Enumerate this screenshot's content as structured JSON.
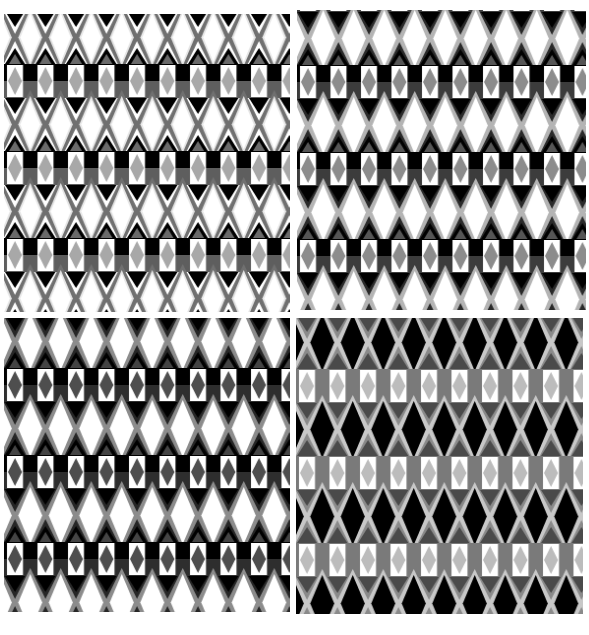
{
  "figure": {
    "panels": [
      {
        "id": "top-left",
        "x": 4,
        "y": 14,
        "w": 286,
        "h": 298,
        "offset_y": 50,
        "colors": {
          "diamond": "#ffffff",
          "diamond_halo": "#e6e6e6",
          "outline": "#707070",
          "tri_down": "#000000",
          "tri_up": "#6a6a6a",
          "band_top": "#000000",
          "band_bottom": "#5e5e5e",
          "cell": "#ffffff",
          "cell_diamond": "#a8a8a8",
          "bg": "#ffffff"
        }
      },
      {
        "id": "top-right",
        "x": 297,
        "y": 10,
        "w": 289,
        "h": 300,
        "offset_y": 55,
        "colors": {
          "diamond": "#ffffff",
          "diamond_halo": "#ffffff",
          "outline": "#b4b4b4",
          "tri_down": "#000000",
          "tri_up": "#555555",
          "band_top": "#000000",
          "band_bottom": "#3c3c3c",
          "cell": "#ffffff",
          "cell_diamond": "#8c8c8c",
          "bg": "#2a2a2a"
        }
      },
      {
        "id": "bottom-left",
        "x": 4,
        "y": 318,
        "w": 286,
        "h": 294,
        "offset_y": 50,
        "colors": {
          "diamond": "#ffffff",
          "diamond_halo": "#ffffff",
          "outline": "#8c8c8c",
          "tri_down": "#000000",
          "tri_up": "#444444",
          "band_top": "#000000",
          "band_bottom": "#2e2e2e",
          "cell": "#ffffff",
          "cell_diamond": "#4e4e4e",
          "bg": "#262626"
        }
      },
      {
        "id": "bottom-right",
        "x": 296,
        "y": 318,
        "w": 287,
        "h": 296,
        "offset_y": 51,
        "colors": {
          "diamond": "#000000",
          "diamond_halo": "#000000",
          "outline": "#c8c8c8",
          "tri_down": "#4a4a4a",
          "tri_up": "#4a4a4a",
          "band_top": "#7a7a7a",
          "band_bottom": "#7a7a7a",
          "cell": "#ffffff",
          "cell_diamond": "#bcbcbc",
          "bg": "#8a8a8a"
        }
      }
    ],
    "tile": {
      "width": 30.5,
      "height": 87
    }
  }
}
